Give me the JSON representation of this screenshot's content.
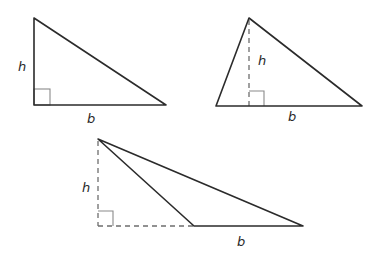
{
  "diagram": {
    "title": "",
    "colors": {
      "edge": "#2b2b2b",
      "dashed": "#6e6e6e",
      "right_angle": "#8a8a8a",
      "label": "#2a2a2a",
      "background": "#ffffff"
    },
    "triangles": [
      {
        "name": "right-triangle",
        "vertices": [
          [
            34,
            18
          ],
          [
            34,
            105
          ],
          [
            166,
            105
          ]
        ],
        "right_angle_box": {
          "x": 34,
          "y": 89,
          "size": 16
        },
        "height_label": "h",
        "base_label": "b",
        "height_label_pos": [
          22,
          71
        ],
        "base_label_pos": [
          91,
          123
        ]
      },
      {
        "name": "acute-triangle",
        "vertices": [
          [
            249,
            18
          ],
          [
            216,
            106
          ],
          [
            362,
            106
          ]
        ],
        "altitude": {
          "from": [
            249,
            18
          ],
          "to": [
            249,
            106
          ]
        },
        "right_angle_box": {
          "x": 249,
          "y": 91,
          "size": 15
        },
        "height_label": "h",
        "base_label": "b",
        "height_label_pos": [
          262,
          65
        ],
        "base_label_pos": [
          292,
          121
        ]
      },
      {
        "name": "obtuse-triangle",
        "vertices": [
          [
            98,
            139
          ],
          [
            194,
            226
          ],
          [
            303,
            226
          ]
        ],
        "altitude": {
          "from": [
            98,
            139
          ],
          "to": [
            98,
            226
          ]
        },
        "base_extension": {
          "from": [
            98,
            226
          ],
          "to": [
            194,
            226
          ]
        },
        "right_angle_box": {
          "x": 98,
          "y": 211,
          "size": 15
        },
        "height_label": "h",
        "base_label": "b",
        "height_label_pos": [
          86,
          192
        ],
        "base_label_pos": [
          241,
          246
        ]
      }
    ]
  }
}
